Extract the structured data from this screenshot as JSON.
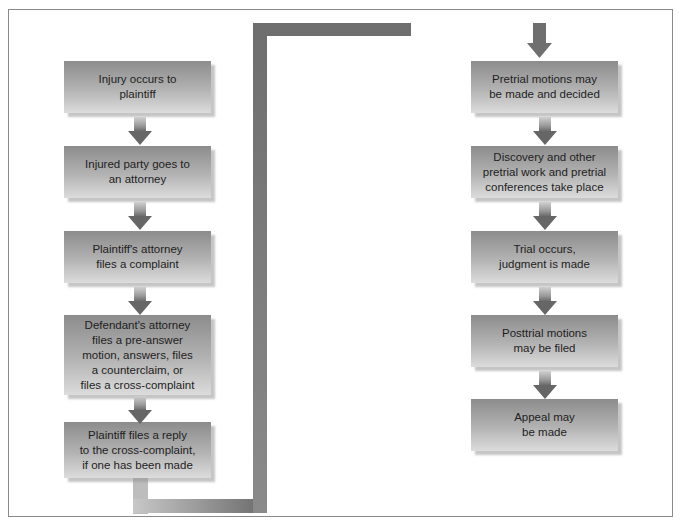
{
  "diagram": {
    "type": "flowchart",
    "title": "",
    "left_column": [
      {
        "id": "step-1",
        "lines": [
          "Injury occurs to",
          "plaintiff"
        ]
      },
      {
        "id": "step-2",
        "lines": [
          "Injured party goes to",
          "an attorney"
        ]
      },
      {
        "id": "step-3",
        "lines": [
          "Plaintiff's attorney",
          "files a complaint"
        ]
      },
      {
        "id": "step-4",
        "lines": [
          "Defendant's attorney",
          "files a pre-answer",
          "motion, answers, files",
          "a counterclaim, or",
          "files a cross-complaint"
        ]
      },
      {
        "id": "step-5",
        "lines": [
          "Plaintiff files a reply",
          "to the cross-complaint,",
          "if one has been made"
        ]
      }
    ],
    "right_column": [
      {
        "id": "step-6",
        "lines": [
          "Pretrial motions may",
          "be made and decided"
        ]
      },
      {
        "id": "step-7",
        "lines": [
          "Discovery and other",
          "pretrial work and pretrial",
          "conferences take place"
        ]
      },
      {
        "id": "step-8",
        "lines": [
          "Trial occurs,",
          "judgment is made"
        ]
      },
      {
        "id": "step-9",
        "lines": [
          "Posttrial motions",
          "may be filed"
        ]
      },
      {
        "id": "step-10",
        "lines": [
          "Appeal may",
          "be made"
        ]
      }
    ],
    "edges": [
      [
        "step-1",
        "step-2"
      ],
      [
        "step-2",
        "step-3"
      ],
      [
        "step-3",
        "step-4"
      ],
      [
        "step-4",
        "step-5"
      ],
      [
        "step-5",
        "step-6"
      ],
      [
        "step-6",
        "step-7"
      ],
      [
        "step-7",
        "step-8"
      ],
      [
        "step-8",
        "step-9"
      ],
      [
        "step-9",
        "step-10"
      ]
    ],
    "colors": {
      "box_top": "#8c8c8c",
      "box_bottom": "#dcdcdc",
      "connector": "#777777",
      "frame": "#8a8a8a",
      "text": "#1e1e1e"
    }
  }
}
